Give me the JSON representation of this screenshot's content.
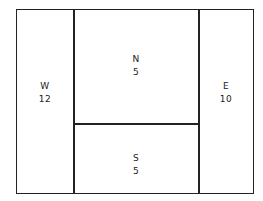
{
  "regions": [
    {
      "id": "W",
      "name": "W",
      "value": "12"
    },
    {
      "id": "N",
      "name": "N",
      "value": "5"
    },
    {
      "id": "S",
      "name": "S",
      "value": "5"
    },
    {
      "id": "E",
      "name": "E",
      "value": "10"
    }
  ],
  "colors": {
    "line": "#222222",
    "background": "#ffffff"
  }
}
